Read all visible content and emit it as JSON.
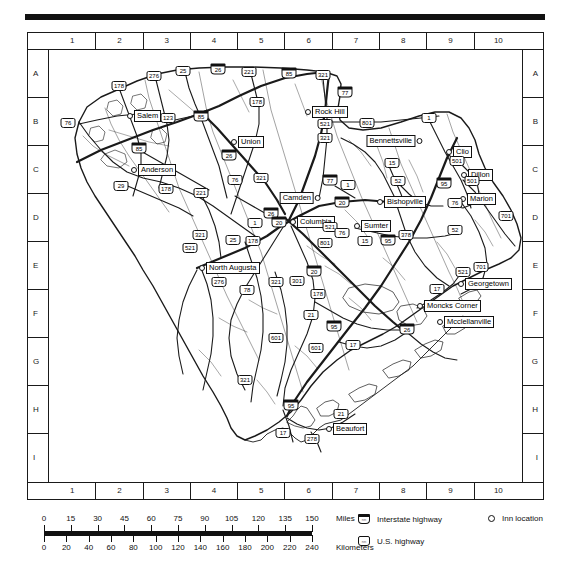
{
  "map": {
    "title": "South Carolina road map",
    "region": "South Carolina",
    "grid": {
      "columns": [
        "1",
        "2",
        "3",
        "4",
        "5",
        "6",
        "7",
        "8",
        "9",
        "10"
      ],
      "rows": [
        "A",
        "B",
        "C",
        "D",
        "E",
        "F",
        "G",
        "H",
        "I"
      ]
    },
    "cities": [
      {
        "name": "Salem",
        "x": 78,
        "y": 66,
        "side": "right"
      },
      {
        "name": "Anderson",
        "x": 82,
        "y": 120,
        "side": "right"
      },
      {
        "name": "Union",
        "x": 182,
        "y": 92,
        "side": "right"
      },
      {
        "name": "Rock Hill",
        "x": 256,
        "y": 62,
        "side": "right"
      },
      {
        "name": "Bennettsville",
        "x": 373,
        "y": 91,
        "side": "left"
      },
      {
        "name": "Clio",
        "x": 397,
        "y": 102,
        "side": "right"
      },
      {
        "name": "Dillon",
        "x": 412,
        "y": 125,
        "side": "right"
      },
      {
        "name": "Marion",
        "x": 411,
        "y": 149,
        "side": "right"
      },
      {
        "name": "Camden",
        "x": 272,
        "y": 148,
        "side": "left"
      },
      {
        "name": "Bishopville",
        "x": 328,
        "y": 152,
        "side": "right"
      },
      {
        "name": "Columbia",
        "x": 241,
        "y": 172,
        "side": "right"
      },
      {
        "name": "Sumter",
        "x": 305,
        "y": 176,
        "side": "right"
      },
      {
        "name": "North Augusta",
        "x": 150,
        "y": 218,
        "side": "right"
      },
      {
        "name": "Georgetown",
        "x": 409,
        "y": 234,
        "side": "right"
      },
      {
        "name": "Moncks Corner",
        "x": 368,
        "y": 256,
        "side": "right"
      },
      {
        "name": "Mcclellanville",
        "x": 388,
        "y": 272,
        "side": "right"
      },
      {
        "name": "Beaufort",
        "x": 277,
        "y": 379,
        "side": "right"
      }
    ],
    "shields": [
      {
        "n": "178",
        "t": "us",
        "x": 70,
        "y": 36
      },
      {
        "n": "276",
        "t": "us",
        "x": 105,
        "y": 26
      },
      {
        "n": "25",
        "t": "us",
        "x": 134,
        "y": 21
      },
      {
        "n": "26",
        "t": "i",
        "x": 169,
        "y": 19
      },
      {
        "n": "221",
        "t": "us",
        "x": 200,
        "y": 22
      },
      {
        "n": "85",
        "t": "i",
        "x": 240,
        "y": 23
      },
      {
        "n": "321",
        "t": "us",
        "x": 274,
        "y": 25
      },
      {
        "n": "77",
        "t": "i",
        "x": 296,
        "y": 42
      },
      {
        "n": "76",
        "t": "us",
        "x": 19,
        "y": 73
      },
      {
        "n": "123",
        "t": "us",
        "x": 119,
        "y": 68
      },
      {
        "n": "85",
        "t": "i",
        "x": 152,
        "y": 66
      },
      {
        "n": "85",
        "t": "i",
        "x": 90,
        "y": 98
      },
      {
        "n": "29",
        "t": "us",
        "x": 72,
        "y": 136
      },
      {
        "n": "178",
        "t": "us",
        "x": 117,
        "y": 139
      },
      {
        "n": "221",
        "t": "us",
        "x": 152,
        "y": 143
      },
      {
        "n": "26",
        "t": "i",
        "x": 180,
        "y": 105
      },
      {
        "n": "178",
        "t": "us",
        "x": 208,
        "y": 52
      },
      {
        "n": "321",
        "t": "us",
        "x": 212,
        "y": 128
      },
      {
        "n": "321",
        "t": "us",
        "x": 276,
        "y": 88
      },
      {
        "n": "76",
        "t": "us",
        "x": 186,
        "y": 130
      },
      {
        "n": "77",
        "t": "i",
        "x": 281,
        "y": 130
      },
      {
        "n": "521",
        "t": "us",
        "x": 276,
        "y": 74
      },
      {
        "n": "801",
        "t": "us",
        "x": 318,
        "y": 73
      },
      {
        "n": "1",
        "t": "us",
        "x": 380,
        "y": 68
      },
      {
        "n": "1",
        "t": "us",
        "x": 299,
        "y": 135
      },
      {
        "n": "15",
        "t": "us",
        "x": 343,
        "y": 113
      },
      {
        "n": "52",
        "t": "us",
        "x": 349,
        "y": 131
      },
      {
        "n": "95",
        "t": "i",
        "x": 395,
        "y": 133
      },
      {
        "n": "501",
        "t": "us",
        "x": 408,
        "y": 111
      },
      {
        "n": "501",
        "t": "us",
        "x": 423,
        "y": 131
      },
      {
        "n": "76",
        "t": "us",
        "x": 406,
        "y": 153
      },
      {
        "n": "701",
        "t": "us",
        "x": 457,
        "y": 166
      },
      {
        "n": "17",
        "t": "us",
        "x": 489,
        "y": 190
      },
      {
        "n": "20",
        "t": "i",
        "x": 293,
        "y": 152
      },
      {
        "n": "26",
        "t": "i",
        "x": 222,
        "y": 163
      },
      {
        "n": "20",
        "t": "i",
        "x": 230,
        "y": 172
      },
      {
        "n": "521",
        "t": "us",
        "x": 281,
        "y": 177
      },
      {
        "n": "76",
        "t": "us",
        "x": 293,
        "y": 183
      },
      {
        "n": "801",
        "t": "us",
        "x": 276,
        "y": 193
      },
      {
        "n": "15",
        "t": "us",
        "x": 316,
        "y": 191
      },
      {
        "n": "95",
        "t": "i",
        "x": 339,
        "y": 190
      },
      {
        "n": "378",
        "t": "us",
        "x": 357,
        "y": 185
      },
      {
        "n": "52",
        "t": "us",
        "x": 406,
        "y": 180
      },
      {
        "n": "1",
        "t": "us",
        "x": 206,
        "y": 173
      },
      {
        "n": "321",
        "t": "us",
        "x": 151,
        "y": 185
      },
      {
        "n": "25",
        "t": "us",
        "x": 184,
        "y": 190
      },
      {
        "n": "178",
        "t": "us",
        "x": 204,
        "y": 191
      },
      {
        "n": "276",
        "t": "us",
        "x": 170,
        "y": 232
      },
      {
        "n": "78",
        "t": "us",
        "x": 198,
        "y": 240
      },
      {
        "n": "321",
        "t": "us",
        "x": 227,
        "y": 232
      },
      {
        "n": "301",
        "t": "us",
        "x": 248,
        "y": 231
      },
      {
        "n": "20",
        "t": "i",
        "x": 265,
        "y": 221
      },
      {
        "n": "178",
        "t": "us",
        "x": 269,
        "y": 244
      },
      {
        "n": "21",
        "t": "us",
        "x": 262,
        "y": 265
      },
      {
        "n": "95",
        "t": "i",
        "x": 285,
        "y": 276
      },
      {
        "n": "601",
        "t": "us",
        "x": 227,
        "y": 288
      },
      {
        "n": "17",
        "t": "us",
        "x": 304,
        "y": 295
      },
      {
        "n": "26",
        "t": "i",
        "x": 358,
        "y": 279
      },
      {
        "n": "17",
        "t": "us",
        "x": 388,
        "y": 239
      },
      {
        "n": "521",
        "t": "us",
        "x": 414,
        "y": 222
      },
      {
        "n": "701",
        "t": "us",
        "x": 432,
        "y": 217
      },
      {
        "n": "321",
        "t": "us",
        "x": 196,
        "y": 330
      },
      {
        "n": "95",
        "t": "i",
        "x": 242,
        "y": 355
      },
      {
        "n": "17",
        "t": "us",
        "x": 234,
        "y": 383
      },
      {
        "n": "278",
        "t": "us",
        "x": 263,
        "y": 389
      },
      {
        "n": "21",
        "t": "us",
        "x": 292,
        "y": 364
      },
      {
        "n": "601",
        "t": "us",
        "x": 267,
        "y": 298
      },
      {
        "n": "521",
        "t": "us",
        "x": 141,
        "y": 198
      }
    ]
  },
  "scale": {
    "miles": {
      "unit": "Miles",
      "labels": [
        "0",
        "15",
        "30",
        "45",
        "60",
        "75",
        "90",
        "105",
        "120",
        "135",
        "150"
      ]
    },
    "kilometers": {
      "unit": "Kilometers",
      "labels": [
        "0",
        "20",
        "40",
        "60",
        "80",
        "100",
        "120",
        "140",
        "160",
        "180",
        "200",
        "220",
        "240"
      ]
    }
  },
  "legend": {
    "items": [
      {
        "label": "Interstate highway",
        "icon": "interstate-shield-icon"
      },
      {
        "label": "U.S. highway",
        "icon": "us-highway-shield-icon"
      },
      {
        "label": "Inn location",
        "icon": "inn-location-dot-icon"
      }
    ]
  }
}
